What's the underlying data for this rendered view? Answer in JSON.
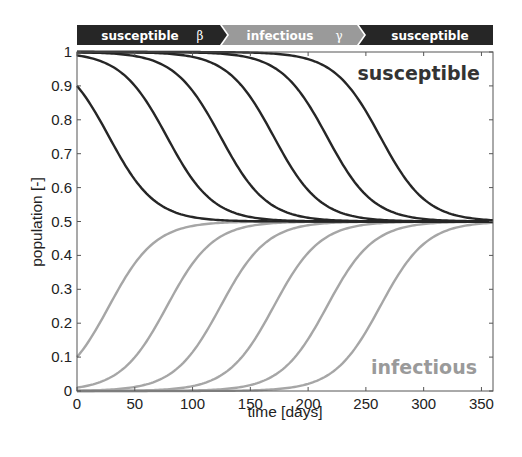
{
  "banner": {
    "stages": [
      {
        "label": "susceptible",
        "symbol": "β",
        "color": "#262626"
      },
      {
        "label": "infectious",
        "symbol": "γ",
        "color": "#9a9a9a"
      },
      {
        "label": "susceptible",
        "symbol": "",
        "color": "#262626"
      }
    ]
  },
  "annotations": {
    "susceptible": {
      "text": "susceptible",
      "color": "#333333"
    },
    "infectious": {
      "text": "infectious",
      "color": "#9a9a9a"
    }
  },
  "colors": {
    "susceptible_line": "#262626",
    "infectious_line": "#a6a6a6",
    "axis": "#555555"
  },
  "chart_data": {
    "type": "line",
    "title": "",
    "xlabel": "time [days]",
    "ylabel": "population [-]",
    "xlim": [
      0,
      360
    ],
    "ylim": [
      0,
      1
    ],
    "xticks": [
      0,
      50,
      100,
      150,
      200,
      250,
      300,
      350
    ],
    "yticks": [
      0,
      0.1,
      0.2,
      0.3,
      0.4,
      0.5,
      0.6,
      0.7,
      0.8,
      0.9,
      1
    ],
    "ytick_labels": [
      "0",
      "0.1",
      "0.2",
      "0.3",
      "0.4",
      "0.5",
      "0.6",
      "0.7",
      "0.8",
      "0.9",
      "1"
    ],
    "grid": false,
    "legend": "none (inline annotations: 'susceptible' top-right, 'infectious' bottom-right)",
    "model": {
      "name": "SIS",
      "beta": 0.1,
      "gamma": 0.05,
      "equilibrium_infectious": 0.5
    },
    "initial_infectious": [
      0.1,
      0.01,
      0.001,
      0.0001,
      1e-05,
      1e-06
    ],
    "x": [
      0,
      30,
      60,
      90,
      120,
      150,
      180,
      210,
      240,
      270,
      300,
      330,
      360
    ],
    "series": [
      {
        "name": "infectious I0=0.1",
        "group": "infectious",
        "values": [
          0.1,
          0.264,
          0.417,
          0.479,
          0.495,
          0.499,
          0.5,
          0.5,
          0.5,
          0.5,
          0.5,
          0.5,
          0.5
        ]
      },
      {
        "name": "infectious I0=0.01",
        "group": "infectious",
        "values": [
          0.01,
          0.042,
          0.145,
          0.324,
          0.446,
          0.487,
          0.497,
          0.5,
          0.5,
          0.5,
          0.5,
          0.5,
          0.5
        ]
      },
      {
        "name": "infectious I0=0.001",
        "group": "infectious",
        "values": [
          0.001,
          0.0045,
          0.019,
          0.076,
          0.223,
          0.392,
          0.471,
          0.493,
          0.498,
          0.5,
          0.5,
          0.5,
          0.5
        ]
      },
      {
        "name": "infectious I0=1e-4",
        "group": "infectious",
        "values": [
          0.0001,
          0.0004,
          0.002,
          0.0089,
          0.037,
          0.133,
          0.309,
          0.439,
          0.485,
          0.497,
          0.5,
          0.5,
          0.5
        ]
      },
      {
        "name": "infectious I0=1e-5",
        "group": "infectious",
        "values": [
          1e-05,
          4e-05,
          0.0002,
          0.0009,
          0.004,
          0.017,
          0.07,
          0.21,
          0.382,
          0.468,
          0.492,
          0.498,
          0.5
        ]
      },
      {
        "name": "infectious I0=1e-6",
        "group": "infectious",
        "values": [
          1e-06,
          4e-06,
          2e-05,
          9e-05,
          0.0004,
          0.0018,
          0.008,
          0.034,
          0.123,
          0.296,
          0.434,
          0.484,
          0.496
        ]
      },
      {
        "name": "susceptible S0=0.9",
        "group": "susceptible",
        "values": [
          0.9,
          0.736,
          0.583,
          0.521,
          0.505,
          0.501,
          0.5,
          0.5,
          0.5,
          0.5,
          0.5,
          0.5,
          0.5
        ]
      },
      {
        "name": "susceptible S0=0.99",
        "group": "susceptible",
        "values": [
          0.99,
          0.958,
          0.855,
          0.676,
          0.554,
          0.513,
          0.503,
          0.5,
          0.5,
          0.5,
          0.5,
          0.5,
          0.5
        ]
      },
      {
        "name": "susceptible S0=0.999",
        "group": "susceptible",
        "values": [
          0.999,
          0.9955,
          0.981,
          0.924,
          0.777,
          0.608,
          0.529,
          0.507,
          0.502,
          0.5,
          0.5,
          0.5,
          0.5
        ]
      },
      {
        "name": "susceptible S0=0.9999",
        "group": "susceptible",
        "values": [
          0.9999,
          0.9996,
          0.998,
          0.9911,
          0.963,
          0.867,
          0.691,
          0.561,
          0.515,
          0.503,
          0.5,
          0.5,
          0.5
        ]
      },
      {
        "name": "susceptible S0=0.99999",
        "group": "susceptible",
        "values": [
          0.99999,
          0.99996,
          0.9998,
          0.9991,
          0.996,
          0.983,
          0.93,
          0.79,
          0.618,
          0.532,
          0.508,
          0.502,
          0.5
        ]
      },
      {
        "name": "susceptible S0=0.999999",
        "group": "susceptible",
        "values": [
          0.999999,
          0.999996,
          0.99998,
          0.99991,
          0.9996,
          0.9982,
          0.992,
          0.966,
          0.877,
          0.704,
          0.566,
          0.516,
          0.504
        ]
      }
    ]
  }
}
